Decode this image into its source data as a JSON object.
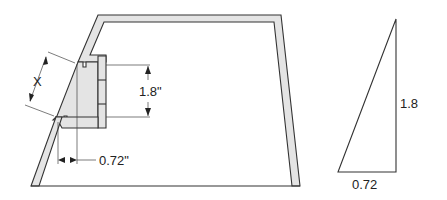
{
  "diagram": {
    "left_figure": {
      "description": "Trapezoidal wall cross-section with inset step",
      "dimensions": {
        "slant_label": "X",
        "vertical_label": "1.8\"",
        "horizontal_label": "0.72\""
      }
    },
    "right_figure": {
      "description": "Right triangle",
      "vertical_side_label": "1.8",
      "base_label": "0.72"
    },
    "colors": {
      "line": "#333333",
      "wall_fill": "#e4e4e4",
      "background": "#ffffff"
    }
  }
}
